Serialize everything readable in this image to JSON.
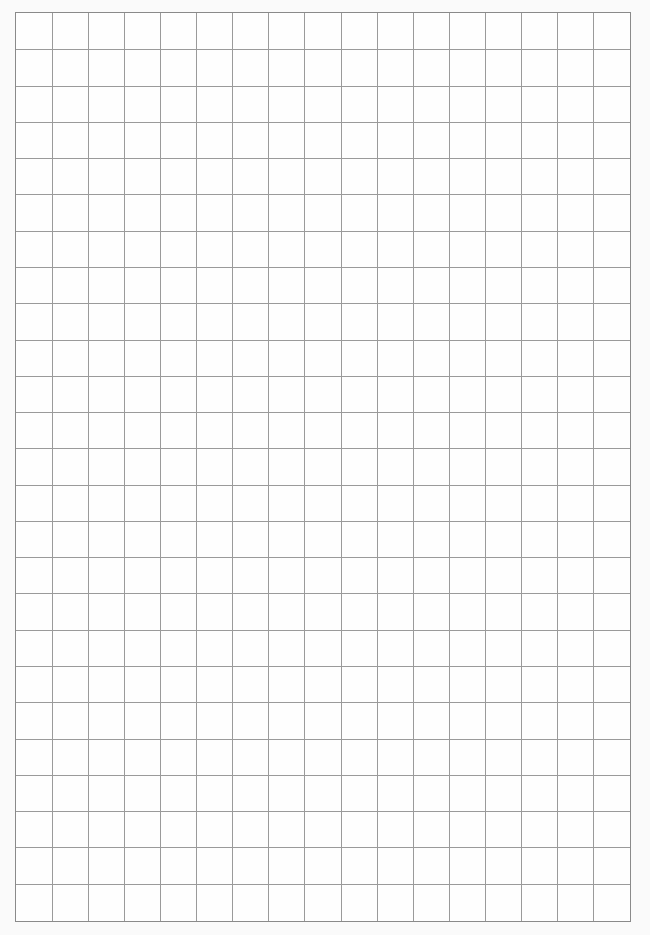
{
  "page": {
    "type": "grid-paper",
    "columns": 17,
    "rows": 25,
    "line_color": "#9a9a9a",
    "border_color": "#8a8a8a",
    "background": "#fefefe"
  }
}
